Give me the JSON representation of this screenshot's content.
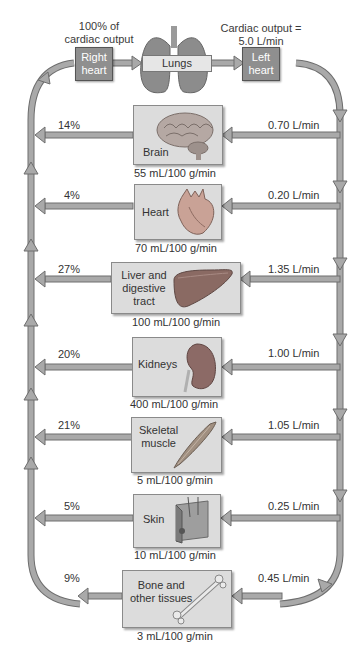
{
  "top": {
    "left_caption": [
      "100% of",
      "cardiac output"
    ],
    "right_caption": [
      "Cardiac output =",
      "5.0 L/min"
    ],
    "right_heart": [
      "Right",
      "heart"
    ],
    "lungs": "Lungs",
    "left_heart": [
      "Left",
      "heart"
    ]
  },
  "organs": [
    {
      "name": [
        "Brain"
      ],
      "percent": "14%",
      "flow": "0.70 L/min",
      "rate": "55 mL/100 g/min",
      "icon": "brain-icon"
    },
    {
      "name": [
        "Heart"
      ],
      "percent": "4%",
      "flow": "0.20 L/min",
      "rate": "70 mL/100 g/min",
      "icon": "heart-icon"
    },
    {
      "name": [
        "Liver and",
        "digestive",
        "tract"
      ],
      "percent": "27%",
      "flow": "1.35 L/min",
      "rate": "100 mL/100 g/min",
      "icon": "liver-icon"
    },
    {
      "name": [
        "Kidneys"
      ],
      "percent": "20%",
      "flow": "1.00 L/min",
      "rate": "400 mL/100 g/min",
      "icon": "kidney-icon"
    },
    {
      "name": [
        "Skeletal",
        "muscle"
      ],
      "percent": "21%",
      "flow": "1.05 L/min",
      "rate": "5 mL/100 g/min",
      "icon": "muscle-icon"
    },
    {
      "name": [
        "Skin"
      ],
      "percent": "5%",
      "flow": "0.25 L/min",
      "rate": "10 mL/100 g/min",
      "icon": "skin-icon"
    },
    {
      "name": [
        "Bone and",
        "other tissues"
      ],
      "percent": "9%",
      "flow": "0.45 L/min",
      "rate": "3 mL/100 g/min",
      "icon": "bone-icon"
    }
  ],
  "colors": {
    "arrow_fill": "#a9a9a9",
    "arrow_stroke": "#6e6e6e",
    "box_fill": "#dcdcdc",
    "heart_box_fill": "#8f8f8f"
  }
}
